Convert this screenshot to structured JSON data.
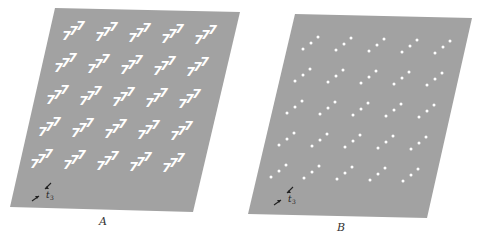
{
  "figure": {
    "background": "#ffffff",
    "panel_fill": "#a2a2a2",
    "motif_color": "#ffffff",
    "annotation_color": "#222222"
  },
  "panels": [
    {
      "id": "A",
      "label": "A",
      "description": "Lattice of 777 motifs",
      "corners": [
        [
          55,
          8
        ],
        [
          240,
          12
        ],
        [
          193,
          212
        ],
        [
          10,
          207
        ]
      ],
      "motif": "777",
      "rows": 5,
      "cols": 5,
      "origin": [
        62,
        40
      ],
      "col_step": [
        33,
        1
      ],
      "row_step": [
        -8,
        32
      ],
      "annotation": {
        "symbol": "t",
        "subscript": "3",
        "pos": [
          44,
          195
        ]
      }
    },
    {
      "id": "B",
      "label": "B",
      "description": "Lattice of 3-dot motifs",
      "corners": [
        [
          295,
          14
        ],
        [
          472,
          18
        ],
        [
          427,
          218
        ],
        [
          248,
          214
        ]
      ],
      "motif": "dots",
      "rows": 5,
      "cols": 5,
      "origin": [
        303,
        49
      ],
      "col_step": [
        33,
        1
      ],
      "row_step": [
        -8,
        32
      ],
      "annotation": {
        "symbol": "t",
        "subscript": "3",
        "pos": [
          286,
          199
        ]
      }
    }
  ]
}
